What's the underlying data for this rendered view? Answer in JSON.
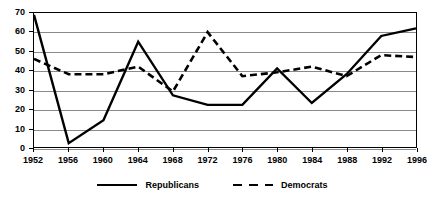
{
  "chart_data": {
    "type": "line",
    "title": "",
    "subtitle": "",
    "xlabel": "",
    "ylabel": "",
    "categories": [
      1952,
      1956,
      1960,
      1964,
      1968,
      1972,
      1976,
      1980,
      1984,
      1988,
      1992,
      1996
    ],
    "xtick_labels": [
      "1952",
      "1956",
      "1960",
      "1964",
      "1968",
      "1972",
      "1976",
      "1980",
      "1984",
      "1988",
      "1992",
      "1996"
    ],
    "ytick_labels": [
      "0",
      "10",
      "20",
      "30",
      "40",
      "50",
      "60",
      "70"
    ],
    "ytick_values": [
      0,
      10,
      20,
      30,
      40,
      50,
      60,
      70
    ],
    "xlim": [
      1952,
      1996
    ],
    "ylim": [
      0,
      70
    ],
    "grid": true,
    "legend_position": "bottom",
    "series": [
      {
        "name": "Republicans",
        "style": "solid",
        "color": "#000000",
        "values": [
          69,
          2,
          14,
          55,
          27,
          22,
          22,
          41,
          23,
          38,
          58,
          62
        ]
      },
      {
        "name": "Democrats",
        "style": "dashed",
        "color": "#000000",
        "values": [
          46,
          38,
          38,
          42,
          29,
          60,
          37,
          39,
          42,
          37,
          48,
          47
        ]
      }
    ]
  },
  "legend": {
    "entries": [
      {
        "label": "Republicans",
        "style": "solid"
      },
      {
        "label": "Democrats",
        "style": "dashed"
      }
    ]
  }
}
